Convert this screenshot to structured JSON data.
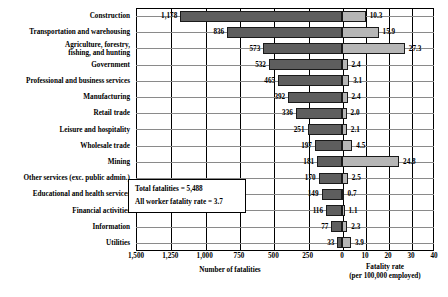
{
  "chart_data": {
    "type": "bar",
    "title": "",
    "subtitle": "",
    "orientation": "horizontal",
    "grid": true,
    "legend_position": "none",
    "categories": [
      "Construction",
      "Transportation and warehousing",
      "Agriculture, forestry,\nfishing, and hunting",
      "Government",
      "Professional and business services",
      "Manufacturing",
      "Retail trade",
      "Leisure and hospitality",
      "Wholesale trade",
      "Mining",
      "Other services (exc. public admin.)",
      "Educational and health services",
      "Financial activities",
      "Information",
      "Utilities"
    ],
    "series": [
      {
        "name": "Number of fatalities",
        "axis": "left",
        "color": "#5e5e5e",
        "values": [
          1178,
          836,
          573,
          532,
          465,
          392,
          336,
          251,
          197,
          181,
          170,
          149,
          116,
          77,
          33
        ]
      },
      {
        "name": "Fatality rate (per 100,000 employed)",
        "axis": "right",
        "color": "#b6b6b6",
        "values": [
          10.3,
          15.9,
          27.3,
          2.4,
          3.1,
          2.4,
          2.0,
          2.1,
          4.5,
          24.8,
          2.5,
          0.7,
          1.1,
          2.3,
          3.9
        ]
      }
    ],
    "left_axis": {
      "label": "Number of fatalities",
      "ticks": [
        "1,500",
        "1,250",
        "1,000",
        "750",
        "500",
        "250",
        "0"
      ],
      "tick_values": [
        1500,
        1250,
        1000,
        750,
        500,
        250,
        0
      ],
      "range": [
        1500,
        0
      ],
      "direction": "reversed"
    },
    "right_axis": {
      "label": "Fatality rate",
      "label_sub": "(per 100,000 employed)",
      "ticks": [
        "0",
        "10",
        "20",
        "30",
        "40"
      ],
      "tick_values": [
        0,
        10,
        20,
        30,
        40
      ],
      "range": [
        0,
        40
      ]
    },
    "annotations": [
      "Total fatalities = 5,488",
      "All worker fatality rate = 3.7"
    ]
  }
}
